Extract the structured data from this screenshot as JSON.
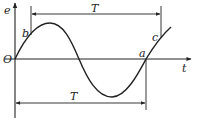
{
  "diagram": {
    "axes": {
      "vertical_label": "e",
      "horizontal_label": "t",
      "origin_label": "O"
    },
    "points": {
      "a": "a",
      "b": "b",
      "c": "c"
    },
    "periods": {
      "top_label": "T",
      "bottom_label": "T"
    },
    "colors": {
      "line": "#222222",
      "background": "#ffffff"
    }
  }
}
